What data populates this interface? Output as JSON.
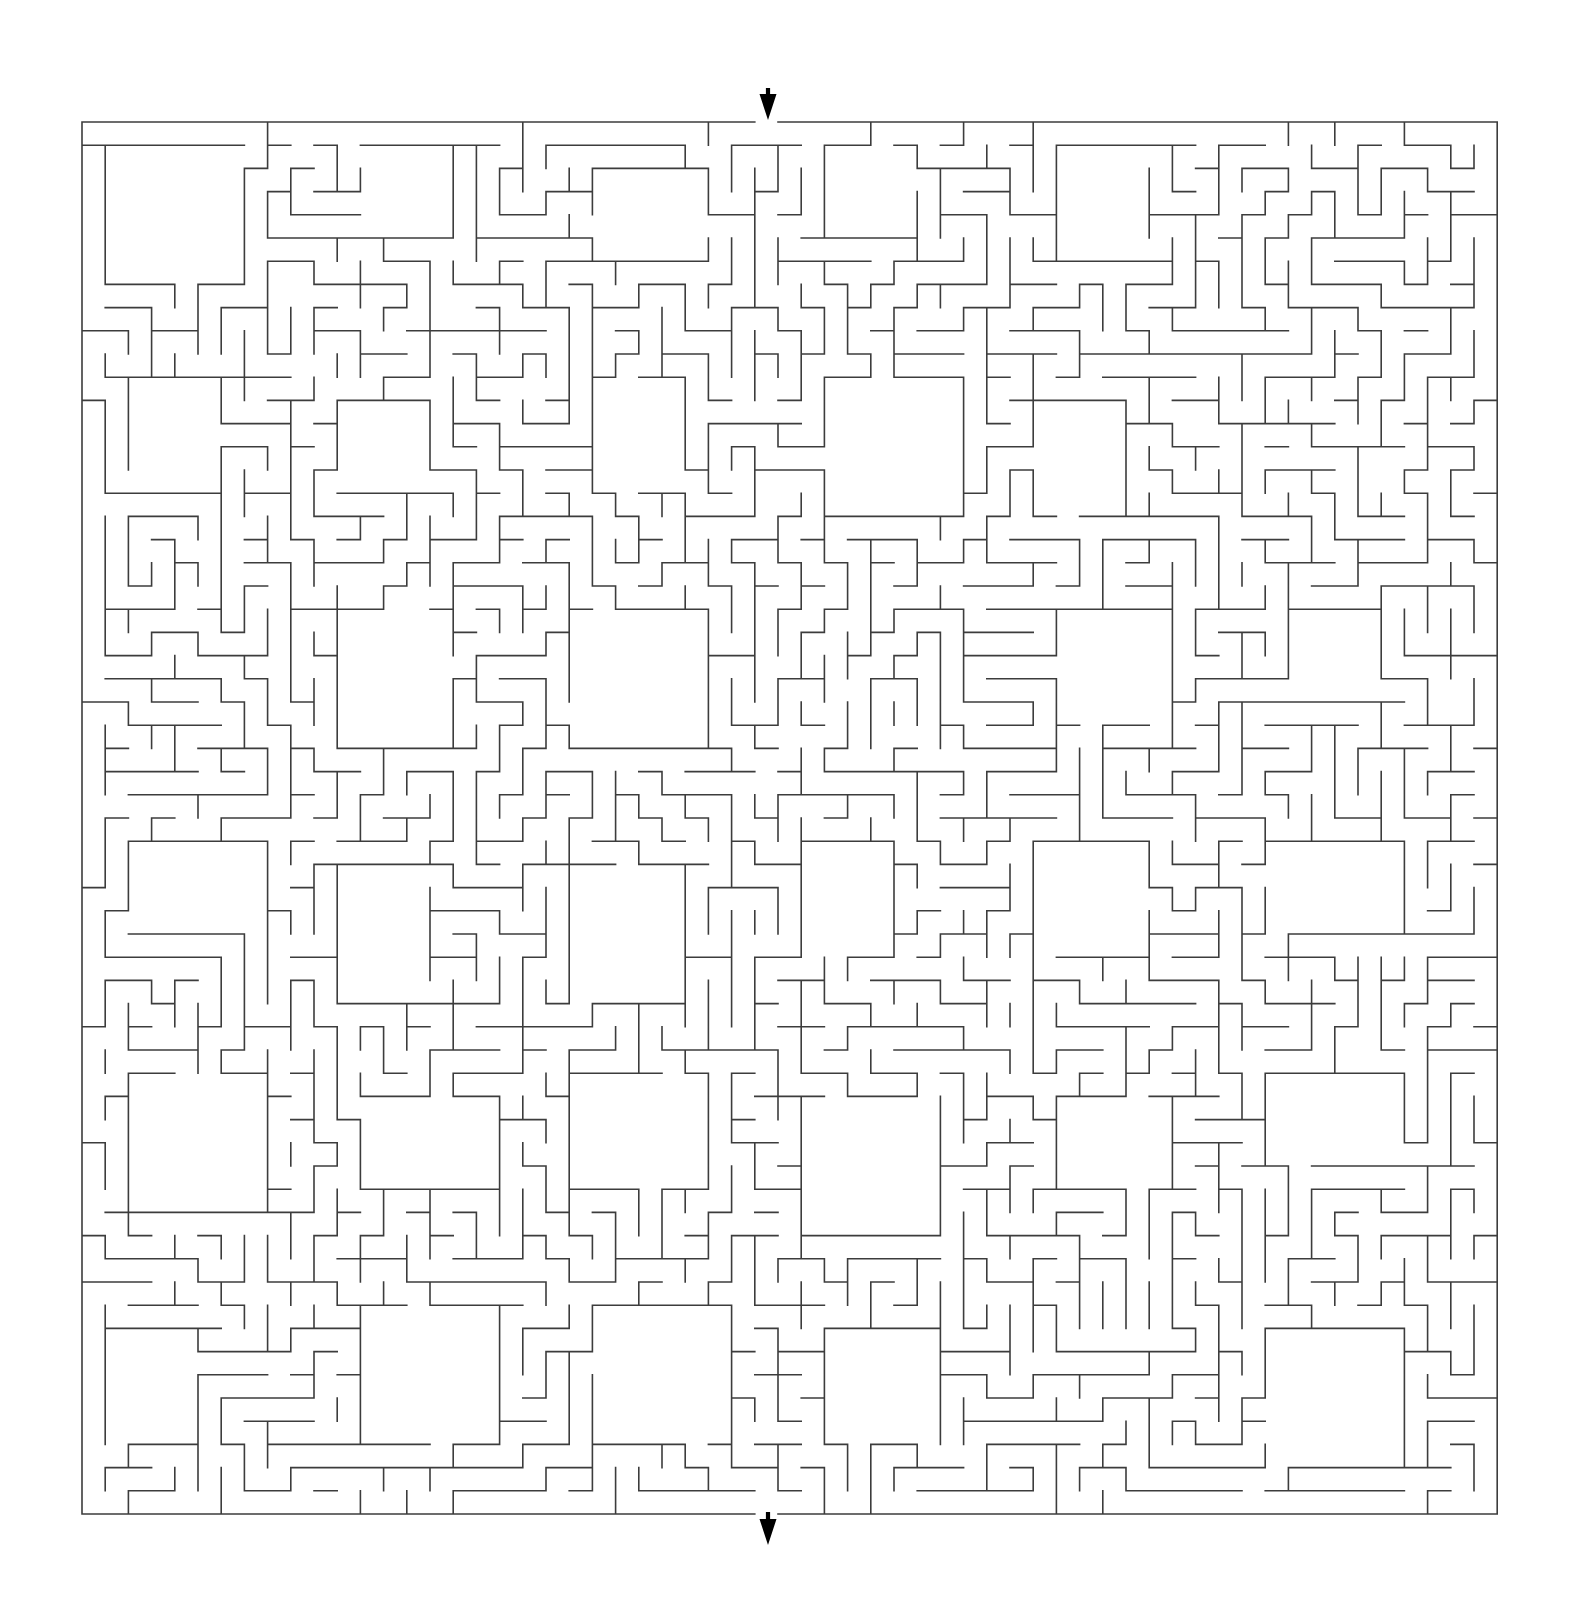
{
  "page": {
    "background_color": "#ffffff",
    "width": 1575,
    "height": 1619
  },
  "maze": {
    "type": "rectangular-grid-maze-with-rooms",
    "wall_color": "#3c3c3c",
    "wall_thickness": 1.6,
    "origin_x": 82,
    "origin_y": 122,
    "cell_size": 23.2,
    "cols": 61,
    "rows": 60,
    "entrance": {
      "label": "entrance",
      "side": "top",
      "cell_col": 29,
      "arrow_direction": "down",
      "arrow_color": "#000000",
      "arrow_x": 768,
      "arrow_tip_y": 120,
      "arrow_tail_y": 88
    },
    "exit": {
      "label": "exit",
      "side": "bottom",
      "cell_col": 29,
      "arrow_direction": "down",
      "arrow_color": "#000000",
      "arrow_x": 768,
      "arrow_tip_y": 1545,
      "arrow_tail_y": 1512
    },
    "rooms": {
      "description": "large open rectangular chambers arranged on a coarse lattice",
      "lattice_step_cols": 10,
      "lattice_step_rows": 10,
      "min_size_cells": 4,
      "max_size_cells": 6
    },
    "generation": {
      "algorithm": "randomized-depth-first-search",
      "seed": 20240917,
      "braid_fraction": 0.03
    }
  }
}
